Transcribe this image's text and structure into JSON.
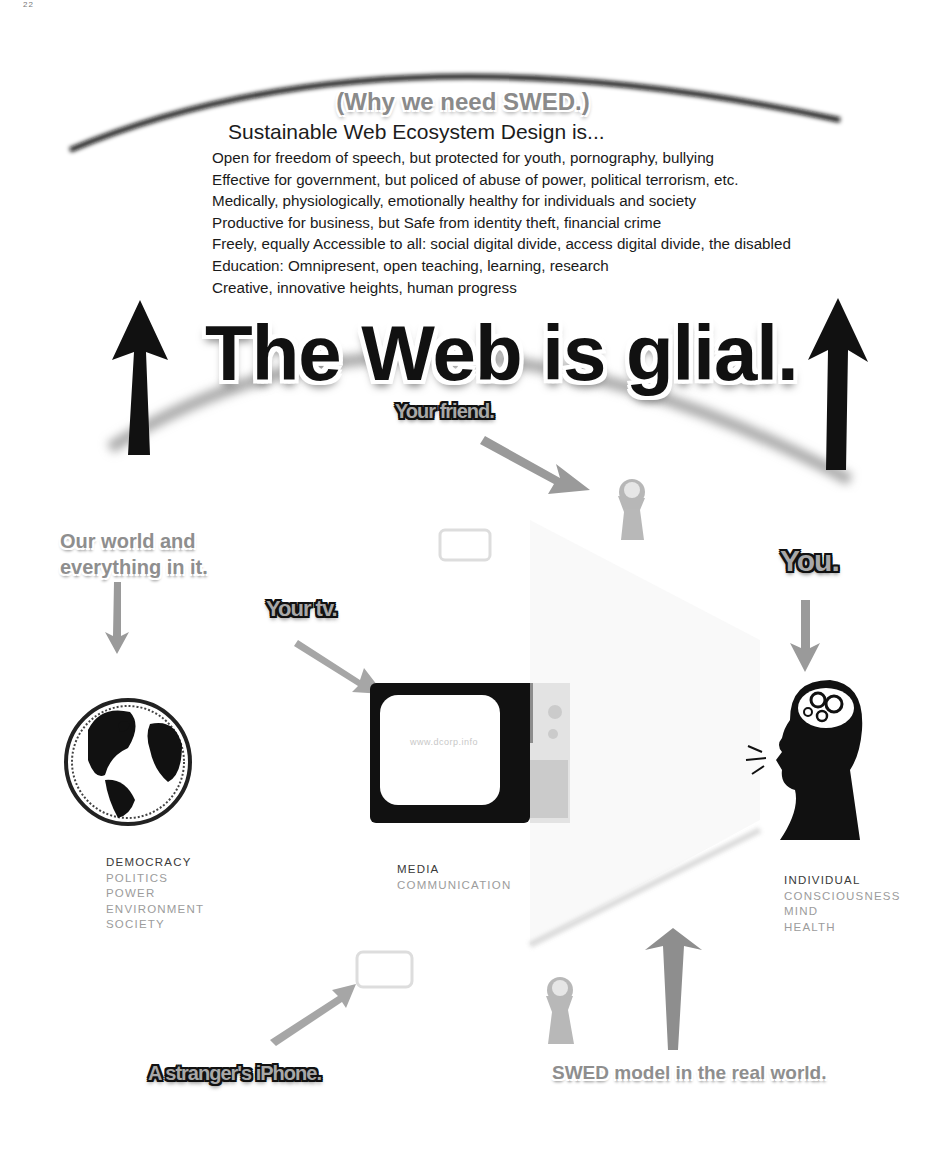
{
  "page_marker": "22",
  "header": {
    "why_title": "(Why we need SWED.)",
    "heading": "Sustainable Web Ecosystem Design is..."
  },
  "criteria": [
    "Open for freedom of speech, but protected for youth, pornography, bullying",
    "Effective for government, but policed of abuse of power, political terrorism, etc.",
    "Medically, physiologically, emotionally healthy for individuals and society",
    "Productive for business, but Safe from identity theft, financial crime",
    "Freely, equally Accessible to all: social digital divide, access digital divide, the disabled",
    "Education: Omnipresent, open teaching, learning, research",
    "Creative, innovative heights, human progress"
  ],
  "main_title": "The Web is glial.",
  "labels": {
    "friend": "Your friend.",
    "world": [
      "Our world and",
      "everything in it."
    ],
    "tv": "Your tv.",
    "you": "You.",
    "iphone": "A stranger's iPhone.",
    "real_world": "SWED model in the real world."
  },
  "nodes": {
    "world": {
      "icon": "globe-icon",
      "primary": "DEMOCRACY",
      "secondary": [
        "POLITICS",
        "POWER",
        "ENVIRONMENT",
        "SOCIETY"
      ]
    },
    "media": {
      "icon": "television-icon",
      "screen_text": "www.dcorp.info",
      "primary": "MEDIA",
      "secondary": [
        "COMMUNICATION"
      ]
    },
    "individual": {
      "icon": "head-with-gears-icon",
      "primary": "INDIVIDUAL",
      "secondary": [
        "CONSCIOUSNESS",
        "MIND",
        "HEALTH"
      ]
    }
  },
  "colors": {
    "ink": "#111111",
    "arrow_gray": "#9a9a9a",
    "text_gray": "#9c9c9c",
    "background": "#ffffff"
  }
}
